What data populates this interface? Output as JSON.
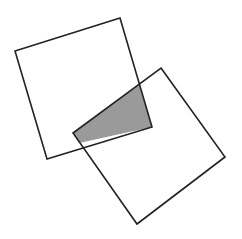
{
  "diagram": {
    "title": "",
    "background": "#ffffff",
    "stroke_color": "#222222",
    "overlap_fill": "#9a9a9a",
    "shapes": [
      {
        "id": "square-1",
        "type": "square",
        "points": [
          [
            15,
            51
          ],
          [
            120,
            18
          ],
          [
            152,
            127
          ],
          [
            47,
            159
          ]
        ],
        "fill": "none"
      },
      {
        "id": "square-2",
        "type": "square",
        "points": [
          [
            161,
            68
          ],
          [
            225,
            157
          ],
          [
            137,
            224
          ],
          [
            73,
            133
          ]
        ],
        "fill": "none"
      },
      {
        "id": "overlap-region",
        "type": "quadrilateral",
        "points": [
          [
            139,
            85
          ],
          [
            152,
            127
          ],
          [
            79,
            143
          ],
          [
            73,
            133
          ]
        ],
        "fill": "#9a9a9a"
      }
    ]
  }
}
